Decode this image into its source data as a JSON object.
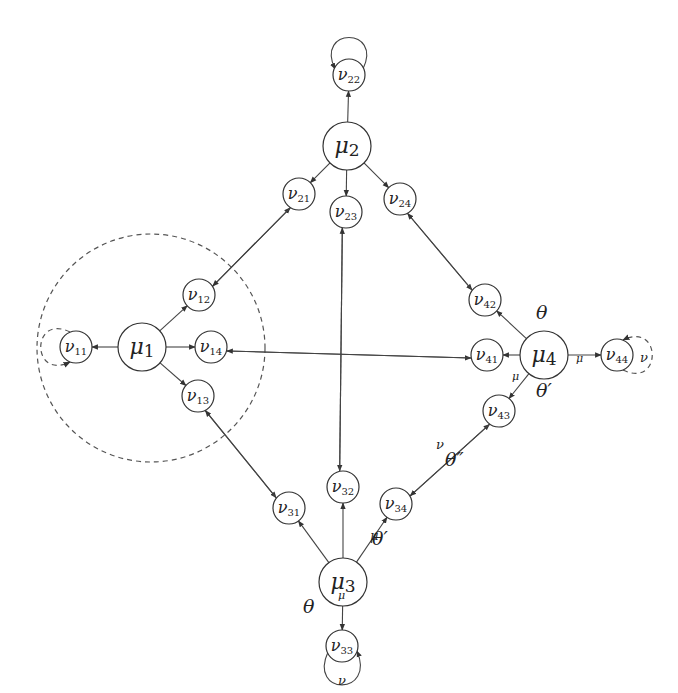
{
  "diagram": {
    "title": "",
    "nodes": [
      {
        "id": "mu1",
        "base": "μ",
        "sub": "1",
        "x": 142,
        "y": 347,
        "r": 24,
        "kind": "mu"
      },
      {
        "id": "mu2",
        "base": "μ",
        "sub": "2",
        "x": 347,
        "y": 146,
        "r": 24,
        "kind": "mu"
      },
      {
        "id": "mu3",
        "base": "μ",
        "sub": "3",
        "x": 343,
        "y": 582,
        "r": 24,
        "kind": "mu"
      },
      {
        "id": "mu4",
        "base": "μ",
        "sub": "4",
        "x": 544,
        "y": 355,
        "r": 24,
        "kind": "mu"
      },
      {
        "id": "nu11",
        "base": "ν",
        "sub": "11",
        "x": 76,
        "y": 347,
        "r": 16,
        "kind": "nu"
      },
      {
        "id": "nu12",
        "base": "ν",
        "sub": "12",
        "x": 199,
        "y": 295,
        "r": 16,
        "kind": "nu"
      },
      {
        "id": "nu13",
        "base": "ν",
        "sub": "13",
        "x": 198,
        "y": 396,
        "r": 16,
        "kind": "nu"
      },
      {
        "id": "nu14",
        "base": "ν",
        "sub": "14",
        "x": 211,
        "y": 347,
        "r": 16,
        "kind": "nu"
      },
      {
        "id": "nu21",
        "base": "ν",
        "sub": "21",
        "x": 299,
        "y": 194,
        "r": 16,
        "kind": "nu"
      },
      {
        "id": "nu22",
        "base": "ν",
        "sub": "22",
        "x": 349,
        "y": 75,
        "r": 16,
        "kind": "nu"
      },
      {
        "id": "nu23",
        "base": "ν",
        "sub": "23",
        "x": 346,
        "y": 212,
        "r": 16,
        "kind": "nu"
      },
      {
        "id": "nu24",
        "base": "ν",
        "sub": "24",
        "x": 400,
        "y": 199,
        "r": 16,
        "kind": "nu"
      },
      {
        "id": "nu31",
        "base": "ν",
        "sub": "31",
        "x": 289,
        "y": 508,
        "r": 16,
        "kind": "nu"
      },
      {
        "id": "nu32",
        "base": "ν",
        "sub": "32",
        "x": 343,
        "y": 487,
        "r": 16,
        "kind": "nu"
      },
      {
        "id": "nu33",
        "base": "ν",
        "sub": "33",
        "x": 342,
        "y": 646,
        "r": 16,
        "kind": "nu"
      },
      {
        "id": "nu34",
        "base": "ν",
        "sub": "34",
        "x": 396,
        "y": 504,
        "r": 16,
        "kind": "nu"
      },
      {
        "id": "nu41",
        "base": "ν",
        "sub": "41",
        "x": 487,
        "y": 355,
        "r": 16,
        "kind": "nu"
      },
      {
        "id": "nu42",
        "base": "ν",
        "sub": "42",
        "x": 485,
        "y": 300,
        "r": 16,
        "kind": "nu"
      },
      {
        "id": "nu43",
        "base": "ν",
        "sub": "43",
        "x": 499,
        "y": 411,
        "r": 16,
        "kind": "nu"
      },
      {
        "id": "nu44",
        "base": "ν",
        "sub": "44",
        "x": 617,
        "y": 355,
        "r": 16,
        "kind": "nu"
      }
    ],
    "edges": [
      {
        "from": "mu1",
        "to": "nu11",
        "style": "solid"
      },
      {
        "from": "mu1",
        "to": "nu12",
        "style": "solid"
      },
      {
        "from": "mu1",
        "to": "nu13",
        "style": "solid"
      },
      {
        "from": "mu1",
        "to": "nu14",
        "style": "solid"
      },
      {
        "from": "mu2",
        "to": "nu21",
        "style": "solid"
      },
      {
        "from": "mu2",
        "to": "nu22",
        "style": "solid"
      },
      {
        "from": "mu2",
        "to": "nu23",
        "style": "solid"
      },
      {
        "from": "mu2",
        "to": "nu24",
        "style": "solid"
      },
      {
        "from": "mu3",
        "to": "nu31",
        "style": "solid"
      },
      {
        "from": "mu3",
        "to": "nu32",
        "style": "solid"
      },
      {
        "from": "mu3",
        "to": "nu33",
        "style": "solid",
        "label": "μ"
      },
      {
        "from": "mu3",
        "to": "nu34",
        "style": "solid",
        "label": "μ"
      },
      {
        "from": "mu4",
        "to": "nu41",
        "style": "solid"
      },
      {
        "from": "mu4",
        "to": "nu42",
        "style": "solid"
      },
      {
        "from": "mu4",
        "to": "nu43",
        "style": "solid",
        "label": "μ"
      },
      {
        "from": "mu4",
        "to": "nu44",
        "style": "solid",
        "label": "μ"
      },
      {
        "from": "nu12",
        "to": "nu21",
        "style": "double"
      },
      {
        "from": "nu21",
        "to": "nu12",
        "style": "double"
      },
      {
        "from": "nu13",
        "to": "nu31",
        "style": "double"
      },
      {
        "from": "nu31",
        "to": "nu13",
        "style": "double"
      },
      {
        "from": "nu14",
        "to": "nu41",
        "style": "double"
      },
      {
        "from": "nu41",
        "to": "nu14",
        "style": "double"
      },
      {
        "from": "nu23",
        "to": "nu32",
        "style": "double"
      },
      {
        "from": "nu32",
        "to": "nu23",
        "style": "double"
      },
      {
        "from": "nu24",
        "to": "nu42",
        "style": "double"
      },
      {
        "from": "nu42",
        "to": "nu24",
        "style": "double"
      },
      {
        "from": "nu34",
        "to": "nu43",
        "style": "double",
        "label": "θ''"
      },
      {
        "from": "nu43",
        "to": "nu34",
        "style": "double",
        "label": "ν"
      }
    ],
    "self_loops": [
      {
        "node": "nu11",
        "style": "dashed",
        "side": "left"
      },
      {
        "node": "nu22",
        "style": "solid",
        "side": "top"
      },
      {
        "node": "nu33",
        "style": "solid",
        "side": "bottom",
        "label": "ν"
      },
      {
        "node": "nu44",
        "style": "dashed",
        "side": "right",
        "label": "ν"
      }
    ],
    "region": {
      "shape": "dashed-circle",
      "cx": 151,
      "cy": 348,
      "r": 114,
      "encloses": "mu1"
    },
    "annotations": {
      "mu4_theta": "θ",
      "mu4_theta_prime": "θ′",
      "mu3_theta": "θ",
      "mu3_theta_prime": "θ′",
      "theta_double_prime": "θ″",
      "mu": "μ",
      "nu": "ν"
    }
  }
}
